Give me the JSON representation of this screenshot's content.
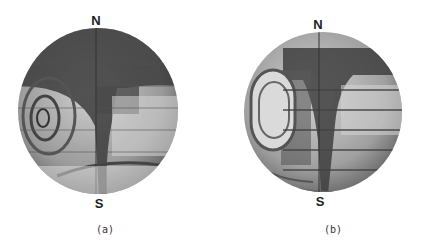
{
  "figure": {
    "panels": [
      {
        "id": "a",
        "caption": "(a)",
        "north_label": "N",
        "south_label": "S",
        "description": "Photograph of a rotating sphere showing dark banded flow pattern with a spiral vortex on the left side and a dark vertical meridian band"
      },
      {
        "id": "b",
        "caption": "(b)",
        "north_label": "N",
        "south_label": "S",
        "description": "Photograph of a rotating sphere showing banded flow pattern with a large oval vortex on the left and dark T-shaped band near the meridian"
      }
    ],
    "colors": {
      "background": "#ffffff",
      "sphere_light": "#d8d8d8",
      "sphere_dark": "#3a3a3a",
      "label": "#222222"
    }
  }
}
